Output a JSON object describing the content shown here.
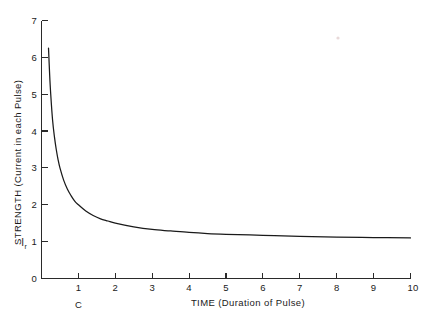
{
  "chart_data": {
    "type": "line",
    "title": "",
    "subtitle": "",
    "xlabel": "TIME  (Duration of Pulse)",
    "ylabel": "STRENGTH  (Current in each Pulse)",
    "xlim": [
      0,
      10
    ],
    "ylim": [
      0,
      7
    ],
    "grid": false,
    "legend": null,
    "x_ticks": [
      1,
      2,
      3,
      4,
      5,
      6,
      7,
      8,
      9,
      10
    ],
    "x_tick_labels": [
      "1",
      "2",
      "3",
      "4",
      "5",
      "6",
      "7",
      "8",
      "9",
      "10"
    ],
    "y_ticks": [
      0,
      1,
      2,
      3,
      4,
      5,
      6,
      7
    ],
    "y_tick_labels": [
      "0",
      "1",
      "2",
      "3",
      "4",
      "5",
      "6",
      "7"
    ],
    "annotations": [
      {
        "name": "rheobase",
        "text": "I",
        "subscript": "r",
        "axis": "y",
        "value": 1
      },
      {
        "name": "chronaxie",
        "text": "C",
        "axis": "x",
        "value": 1
      }
    ],
    "series": [
      {
        "name": "strength-duration",
        "formula": "I = Ir * (1 + C/t), Ir = 1.10, C = 1.0",
        "x": [
          0.19,
          0.22,
          0.25,
          0.3,
          0.35,
          0.4,
          0.45,
          0.5,
          0.6,
          0.7,
          0.8,
          0.9,
          1.0,
          1.2,
          1.4,
          1.6,
          1.8,
          2.0,
          2.5,
          3.0,
          3.5,
          4.0,
          4.5,
          5.0,
          6.0,
          7.0,
          8.0,
          9.0,
          10.0
        ],
        "y": [
          6.25,
          5.55,
          5.0,
          4.3,
          3.85,
          3.5,
          3.22,
          3.0,
          2.67,
          2.43,
          2.25,
          2.1,
          2.0,
          1.83,
          1.71,
          1.62,
          1.56,
          1.5,
          1.4,
          1.33,
          1.29,
          1.25,
          1.22,
          1.2,
          1.17,
          1.14,
          1.12,
          1.11,
          1.1
        ]
      }
    ]
  },
  "axis": {
    "y_label": "STRENGTH  (Current in each Pulse)",
    "x_label": "TIME  (Duration of Pulse)",
    "rheobase_symbol": "I",
    "rheobase_subscript": "r",
    "chronaxie_marker": "C",
    "y_tick_0": "0",
    "y_tick_1": "1",
    "y_tick_2": "2",
    "y_tick_3": "3",
    "y_tick_4": "4",
    "y_tick_5": "5",
    "y_tick_6": "6",
    "y_tick_7": "7",
    "x_tick_1": "1",
    "x_tick_2": "2",
    "x_tick_3": "3",
    "x_tick_4": "4",
    "x_tick_5": "5",
    "x_tick_6": "6",
    "x_tick_7": "7",
    "x_tick_8": "8",
    "x_tick_9": "9",
    "x_tick_10": "10"
  },
  "colors": {
    "curve": "#1a1a1a",
    "axis": "#2a2a2a",
    "background": "#ffffff"
  }
}
